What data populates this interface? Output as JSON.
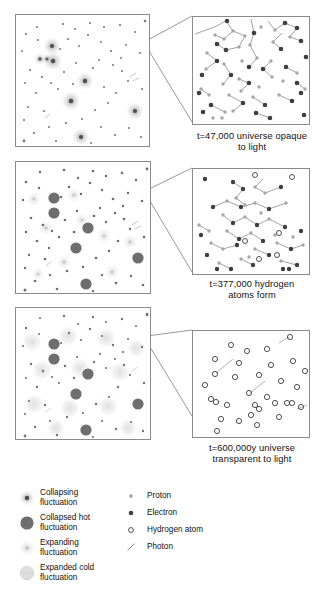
{
  "figure": {
    "background": "#ffffff",
    "ink": "#1a1a1a"
  },
  "stages": [
    {
      "id": "stage-1",
      "caption_line1": "t=47,000 universe opaque",
      "caption_line2": "to light",
      "panel_name": "universe-panel-1",
      "inset_name": "magnified-inset-1",
      "contents": "collapsing fluctuations; free protons and electrons scattering photons"
    },
    {
      "id": "stage-2",
      "caption_line1": "t=377,000 hydrogen",
      "caption_line2": "atoms form",
      "panel_name": "universe-panel-2",
      "inset_name": "magnified-inset-2",
      "contents": "collapsed hot fluctuations and expanding fluctuations; protons, electrons, first hydrogen atoms"
    },
    {
      "id": "stage-3",
      "caption_line1": "t=600,000y universe",
      "caption_line2": "transparent to light",
      "panel_name": "universe-panel-3",
      "inset_name": "magnified-inset-3",
      "contents": "expanded cold fluctuations; almost entirely neutral hydrogen atoms"
    }
  ],
  "legend": {
    "fluctuations": [
      {
        "key": "collapsing",
        "line1": "Collapsing",
        "line2": "fluctuation",
        "symbol": "collapsing-fluctuation-icon"
      },
      {
        "key": "collapsed-hot",
        "line1": "Collapsed hot",
        "line2": "fluctuation",
        "symbol": "collapsed-hot-fluctuation-icon"
      },
      {
        "key": "expanding",
        "line1": "Expanding",
        "line2": "fluctuation",
        "symbol": "expanding-fluctuation-icon"
      },
      {
        "key": "expanded-cold",
        "line1": "Expanded cold",
        "line2": "fluctuation",
        "symbol": "expanded-cold-fluctuation-icon"
      }
    ],
    "particles": [
      {
        "key": "proton",
        "label": "Proton",
        "symbol": "proton-icon"
      },
      {
        "key": "electron",
        "label": "Electron",
        "symbol": "electron-icon"
      },
      {
        "key": "hydrogen-atom",
        "label": "Hydrogen atom",
        "symbol": "hydrogen-atom-icon"
      },
      {
        "key": "photon",
        "label": "Photon",
        "symbol": "photon-icon"
      }
    ]
  },
  "colors": {
    "proton": "#9a9a9a",
    "electron": "#4a4a4a",
    "hydrogen_outline": "#3c3c3c",
    "photon_line": "#6f6f6f",
    "collapsed_hot": "#6e6e6e",
    "expanded_cold": "#cfcfcf",
    "panel_border": "#8a8a8a"
  }
}
